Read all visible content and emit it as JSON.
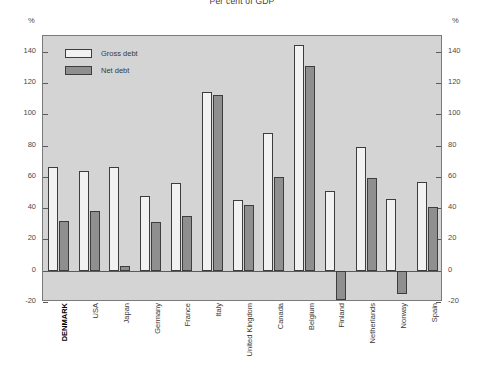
{
  "chart_data": {
    "type": "bar",
    "title": "Per cent of GDP",
    "xlabel": "",
    "ylabel": "%",
    "ylabel_right": "%",
    "ylim": [
      -20,
      150
    ],
    "yticks": [
      140,
      120,
      100,
      80,
      60,
      40,
      20,
      0,
      -20
    ],
    "ytick_labels": [
      "140",
      "120",
      "100",
      "80",
      "60",
      "40",
      "20",
      "0",
      "-20"
    ],
    "grid": false,
    "legend_position": "top-left",
    "highlight_category": "DENMARK",
    "categories": [
      "DENMARK",
      "USA",
      "Japan",
      "Germany",
      "France",
      "Italy",
      "United Kingdom",
      "Canada",
      "Belgium",
      "Finland",
      "Netherlands",
      "Norway",
      "Spain"
    ],
    "series": [
      {
        "name": "Gross debt",
        "color": "#f2f2f2",
        "values": [
          66,
          64,
          66,
          48,
          56,
          114,
          45,
          88,
          144,
          51,
          79,
          46,
          57
        ]
      },
      {
        "name": "Net debt",
        "color": "#8f8f8f",
        "values": [
          32,
          38,
          3,
          31,
          35,
          112,
          42,
          60,
          131,
          -19,
          59,
          -15,
          41
        ]
      }
    ]
  },
  "colors": {
    "plot_background": "#d4d4d4",
    "plot_border": "#7a7a7a",
    "bar_outline": "#3d3d3d",
    "gross_fill": "#f2f2f2",
    "net_fill": "#8f8f8f",
    "axis_text": "#4a4a4a",
    "zero_line": "#5a5a5a",
    "page_background": "#ffffff"
  }
}
